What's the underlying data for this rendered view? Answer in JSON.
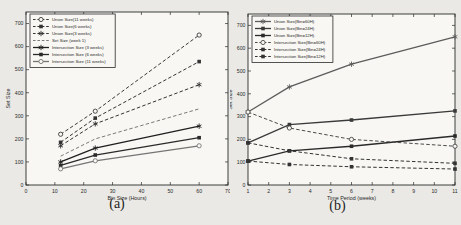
{
  "figure": {
    "background": "#eae9e5",
    "plot_background": "#f8f7f3",
    "frame_color": "#2b2b2b",
    "text_color": "#2b2b2b"
  },
  "chart_data": [
    {
      "type": "line",
      "caption": "(a)",
      "title": "",
      "xlabel": "Bin Size (Hours)",
      "ylabel": "Set Size",
      "xlim": [
        0,
        70
      ],
      "ylim": [
        0,
        750
      ],
      "xticks": [
        0,
        10,
        20,
        30,
        40,
        50,
        60,
        70
      ],
      "yticks": [
        0,
        100,
        200,
        300,
        400,
        500,
        600,
        700
      ],
      "grid": false,
      "legend_position": "top-left",
      "x": [
        12,
        24,
        60
      ],
      "series": [
        {
          "name": "Union Size(11 weeks)",
          "values": [
            220,
            320,
            650
          ],
          "style": "dashed",
          "marker": "circle-open",
          "color": "#3a3a3a"
        },
        {
          "name": "Union Size(6 weeks)",
          "values": [
            185,
            290,
            535
          ],
          "style": "dashed",
          "marker": "square",
          "color": "#333333"
        },
        {
          "name": "Union Size(3 weeks)",
          "values": [
            170,
            265,
            435
          ],
          "style": "dashed",
          "marker": "star",
          "color": "#333333"
        },
        {
          "name": "Set Size (week 1)",
          "values": [
            125,
            200,
            330
          ],
          "style": "dashed",
          "marker": "none",
          "color": "#7a7a7a"
        },
        {
          "name": "Intersection Size (3 weeks)",
          "values": [
            100,
            160,
            255
          ],
          "style": "solid",
          "marker": "star",
          "color": "#1f1f1f"
        },
        {
          "name": "Intersection Size (6 weeks)",
          "values": [
            85,
            130,
            205
          ],
          "style": "solid",
          "marker": "square",
          "color": "#2a2a2a"
        },
        {
          "name": "Intersection Size (11 weeks)",
          "values": [
            70,
            105,
            170
          ],
          "style": "solid",
          "marker": "circle-open",
          "color": "#757575"
        }
      ]
    },
    {
      "type": "line",
      "caption": "(b)",
      "title": "",
      "xlabel": "Time Period (weeks)",
      "ylabel": "Set Size",
      "xlim": [
        1,
        11
      ],
      "ylim": [
        0,
        750
      ],
      "xticks": [
        1,
        2,
        3,
        4,
        5,
        6,
        7,
        8,
        9,
        10,
        11
      ],
      "yticks": [
        0,
        100,
        200,
        300,
        400,
        500,
        600,
        700
      ],
      "grid": false,
      "legend_position": "top-left",
      "x": [
        1,
        3,
        6,
        11
      ],
      "series": [
        {
          "name": "Union Size(Bin=60H)",
          "values": [
            320,
            430,
            530,
            650
          ],
          "style": "solid",
          "marker": "star",
          "color": "#5c5c5c"
        },
        {
          "name": "Union Size(Bin=24H)",
          "values": [
            185,
            265,
            285,
            325
          ],
          "style": "solid",
          "marker": "square",
          "color": "#3a3a3a"
        },
        {
          "name": "Union Size(Bin=12H)",
          "values": [
            105,
            150,
            170,
            215
          ],
          "style": "solid",
          "marker": "square",
          "color": "#2a2a2a"
        },
        {
          "name": "Intersection Size(Bin=60H)",
          "values": [
            320,
            250,
            200,
            170
          ],
          "style": "dashed",
          "marker": "circle-open",
          "color": "#4a4a4a"
        },
        {
          "name": "Intersection Size(Bin=24H)",
          "values": [
            185,
            150,
            115,
            95
          ],
          "style": "dashed",
          "marker": "square",
          "color": "#333333"
        },
        {
          "name": "Intersection Size(Bin=12H)",
          "values": [
            105,
            90,
            80,
            70
          ],
          "style": "dashed",
          "marker": "square",
          "color": "#333333"
        }
      ]
    }
  ]
}
